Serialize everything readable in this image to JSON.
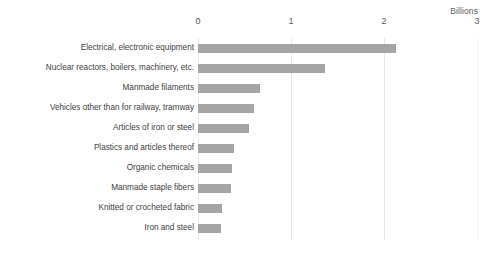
{
  "chart_data": {
    "type": "bar",
    "orientation": "horizontal",
    "title": "",
    "xlabel": "Billions",
    "ylabel": "",
    "xlim": [
      0,
      3
    ],
    "xticks": [
      "0",
      "1",
      "2",
      "3"
    ],
    "xtick_values": [
      0,
      1,
      2,
      3
    ],
    "grid": true,
    "legend": false,
    "bar_color": "#a5a5a5",
    "gridline_color": "#e8e8e8",
    "label_color": "#404040",
    "tick_color": "#595959",
    "categories": [
      "Electrical, electronic equipment",
      "Nuclear reactors, boilers, machinery, etc.",
      "Manmade filaments",
      "Vehicles other than for railway, tramway",
      "Articles of iron or steel",
      "Plastics and articles thereof",
      "Organic chemicals",
      "Manmade staple fibers",
      "Knitted or crocheted fabric",
      "Iron and steel"
    ],
    "values": [
      2.13,
      1.37,
      0.67,
      0.6,
      0.55,
      0.39,
      0.37,
      0.35,
      0.26,
      0.25
    ]
  }
}
